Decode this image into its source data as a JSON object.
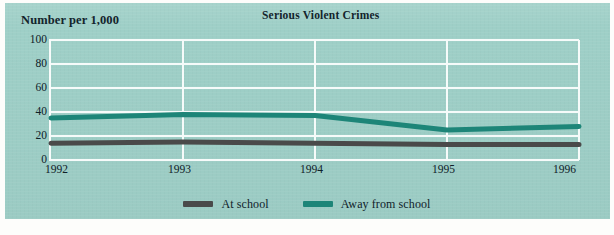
{
  "chart_data": {
    "type": "line",
    "title": "Serious Violent Crimes",
    "ylabel": "Number per 1,000",
    "xlabel": "",
    "categories": [
      "1992",
      "1993",
      "1994",
      "1995",
      "1996"
    ],
    "x": [
      1992,
      1993,
      1994,
      1995,
      1996
    ],
    "ylim": [
      0,
      100
    ],
    "yticks": [
      100,
      80,
      60,
      40,
      20,
      0
    ],
    "grid": true,
    "legend_position": "bottom-center",
    "series": [
      {
        "name": "At school",
        "color": "#4a4a4a",
        "values": [
          14,
          15,
          14,
          13,
          13
        ]
      },
      {
        "name": "Away from school",
        "color": "#1d8578",
        "values": [
          35,
          38,
          37,
          25,
          28
        ]
      }
    ]
  },
  "colors": {
    "background": "#9ecfc7",
    "grid": "#f6fbfa",
    "text": "#13242c",
    "at_school": "#4a4a4a",
    "away_from_school": "#1d8578"
  },
  "legend": {
    "items": [
      {
        "label": "At school"
      },
      {
        "label": "Away from school"
      }
    ]
  }
}
